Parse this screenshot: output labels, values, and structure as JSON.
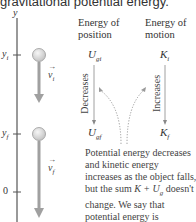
{
  "caption": "gravitational potential energy.",
  "axis": {
    "label": "y",
    "ticks": [
      {
        "label": "y",
        "sub": "i"
      },
      {
        "label": "y",
        "sub": "f"
      },
      {
        "label": "0",
        "sub": ""
      }
    ]
  },
  "vectors": [
    {
      "symbol": "v",
      "sub": "i"
    },
    {
      "symbol": "v",
      "sub": "f"
    }
  ],
  "columns": [
    {
      "heading_line1": "Energy of",
      "heading_line2": "position",
      "top_symbol": "U",
      "top_sub": "gi",
      "arrow_label": "Decreases",
      "bottom_symbol": "U",
      "bottom_sub": "gf"
    },
    {
      "heading_line1": "Energy of",
      "heading_line2": "motion",
      "top_symbol": "K",
      "top_sub": "i",
      "arrow_label": "Increases",
      "bottom_symbol": "K",
      "bottom_sub": "f"
    }
  ],
  "paragraph": {
    "part1": "Potential energy decreases and kinetic energy increases as the object falls, but the sum ",
    "sum": "K + U",
    "sum_sub": "g",
    "part2": " doesn't change. We say that potential energy is ",
    "emph": "transformed",
    "part3": " into kinetic energy."
  },
  "colors": {
    "ball": "#d8d8d8",
    "arrow": "#9a9a9a",
    "axis": "#555555",
    "dotted": "#999999"
  }
}
